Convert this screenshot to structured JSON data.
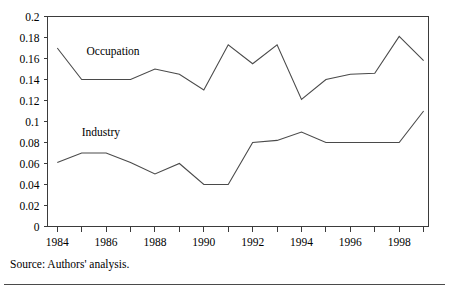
{
  "figure": {
    "source_note": "Source: Authors' analysis."
  },
  "chart_data": {
    "type": "line",
    "title": "",
    "xlabel": "",
    "ylabel": "",
    "x": [
      1984,
      1985,
      1986,
      1987,
      1988,
      1989,
      1990,
      1991,
      1992,
      1993,
      1994,
      1995,
      1996,
      1997,
      1998,
      1999
    ],
    "xlim": [
      1983.6,
      1999.2
    ],
    "ylim": [
      0,
      0.2
    ],
    "grid": false,
    "legend": "inline-labels",
    "x_tick_values": [
      1984,
      1985,
      1986,
      1987,
      1988,
      1989,
      1990,
      1991,
      1992,
      1993,
      1994,
      1995,
      1996,
      1997,
      1998,
      1999
    ],
    "x_tick_labels": [
      "1984",
      "",
      "1986",
      "",
      "1988",
      "",
      "1990",
      "",
      "1992",
      "",
      "1994",
      "",
      "1996",
      "",
      "1998",
      ""
    ],
    "y_ticks": [
      0,
      0.02,
      0.04,
      0.06,
      0.08,
      0.1,
      0.12,
      0.14,
      0.16,
      0.18,
      0.2
    ],
    "y_tick_labels": [
      "0",
      "0.02",
      "0.04",
      "0.06",
      "0.08",
      "0.1",
      "0.12",
      "0.14",
      "0.16",
      "0.18",
      "0.2"
    ],
    "series": [
      {
        "name": "Occupation",
        "color": "#4a4a4a",
        "label_x": 1985.2,
        "label_y": 0.1635,
        "values": [
          0.17,
          0.14,
          0.14,
          0.14,
          0.15,
          0.145,
          0.13,
          0.173,
          0.155,
          0.173,
          0.121,
          0.14,
          0.145,
          0.146,
          0.181,
          0.158
        ]
      },
      {
        "name": "Industry",
        "color": "#4a4a4a",
        "label_x": 1985.0,
        "label_y": 0.0865,
        "values": [
          0.061,
          0.07,
          0.07,
          0.061,
          0.05,
          0.06,
          0.04,
          0.04,
          0.08,
          0.082,
          0.09,
          0.08,
          0.08,
          0.08,
          0.08,
          0.11
        ]
      }
    ]
  }
}
